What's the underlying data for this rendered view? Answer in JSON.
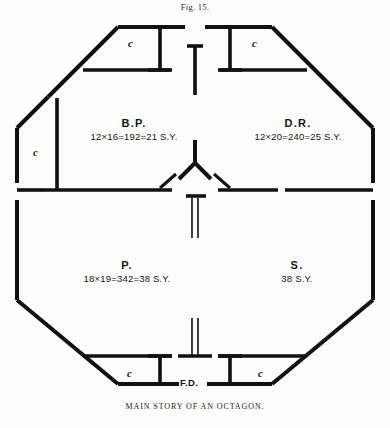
{
  "figure": {
    "number_label": "Fig. 15.",
    "caption": "MAIN STORY OF AN OCTAGON."
  },
  "plan": {
    "shape": "octagon",
    "ink_color": "#111111",
    "paper_color": "#fdfdfb",
    "rooms": [
      {
        "id": "bed-parlor",
        "abbr": "B.P.",
        "dimensions": "12×16=192=21 S.Y.",
        "position": "upper-left"
      },
      {
        "id": "dining-room",
        "abbr": "D.R.",
        "dimensions": "12×20=240=25 S.Y.",
        "position": "upper-right"
      },
      {
        "id": "parlor",
        "abbr": "P.",
        "dimensions": "18×19=342=38 S.Y.",
        "position": "lower-left"
      },
      {
        "id": "sitting-room",
        "abbr": "S.",
        "dimensions": "38  S.Y.",
        "position": "lower-right"
      }
    ],
    "closets": [
      {
        "id": "closet-top-left",
        "label": "c"
      },
      {
        "id": "closet-top-right",
        "label": "c"
      },
      {
        "id": "closet-left",
        "label": "c"
      },
      {
        "id": "closet-bottom-left",
        "label": "c"
      },
      {
        "id": "closet-bottom-right",
        "label": "c"
      }
    ],
    "annotations": [
      {
        "id": "front-door",
        "label": "F.D."
      }
    ]
  }
}
